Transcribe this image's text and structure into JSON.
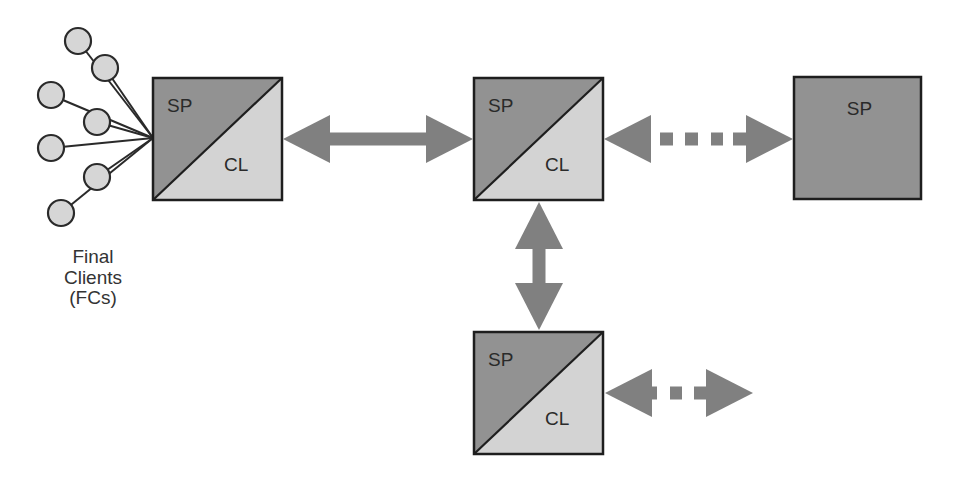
{
  "diagram": {
    "colors": {
      "sp_fill": "#929292",
      "cl_fill": "#d3d3d3",
      "border": "#1e1e1e",
      "arrow": "#808080",
      "client_fill": "#d6d6d6",
      "client_stroke": "#2a2a2a",
      "text": "#2a2a2a"
    },
    "clients": {
      "label_lines": [
        "Final",
        "Clients",
        "(FCs)"
      ],
      "hub": [
        153,
        138
      ],
      "radius": 13,
      "nodes": [
        {
          "cx": 78,
          "cy": 41
        },
        {
          "cx": 105,
          "cy": 68
        },
        {
          "cx": 51,
          "cy": 95
        },
        {
          "cx": 97,
          "cy": 122
        },
        {
          "cx": 51,
          "cy": 148
        },
        {
          "cx": 97,
          "cy": 177
        },
        {
          "cx": 61,
          "cy": 213
        }
      ]
    },
    "nodes": [
      {
        "id": "node-1",
        "type": "split",
        "x": 153,
        "y": 78,
        "w": 129,
        "h": 122,
        "sp_label": "SP",
        "cl_label": "CL"
      },
      {
        "id": "node-2",
        "type": "split",
        "x": 474,
        "y": 78,
        "w": 129,
        "h": 122,
        "sp_label": "SP",
        "cl_label": "CL"
      },
      {
        "id": "node-3",
        "type": "sp-only",
        "x": 794,
        "y": 77,
        "w": 127,
        "h": 122,
        "sp_label": "SP"
      },
      {
        "id": "node-4",
        "type": "split",
        "x": 474,
        "y": 332,
        "w": 129,
        "h": 122,
        "sp_label": "SP",
        "cl_label": "CL"
      }
    ],
    "arrows": [
      {
        "id": "arrow-node1-node2",
        "orientation": "horizontal",
        "style": "solid",
        "from": 283,
        "to": 473,
        "at": 139
      },
      {
        "id": "arrow-node2-node3",
        "orientation": "horizontal",
        "style": "dotted",
        "from": 604,
        "to": 793,
        "at": 139
      },
      {
        "id": "arrow-node2-node4",
        "orientation": "vertical",
        "style": "solid",
        "from": 202,
        "to": 330,
        "at": 539
      },
      {
        "id": "arrow-node4-out",
        "orientation": "horizontal",
        "style": "dotted-short",
        "from": 605,
        "to": 753,
        "at": 393
      }
    ]
  }
}
